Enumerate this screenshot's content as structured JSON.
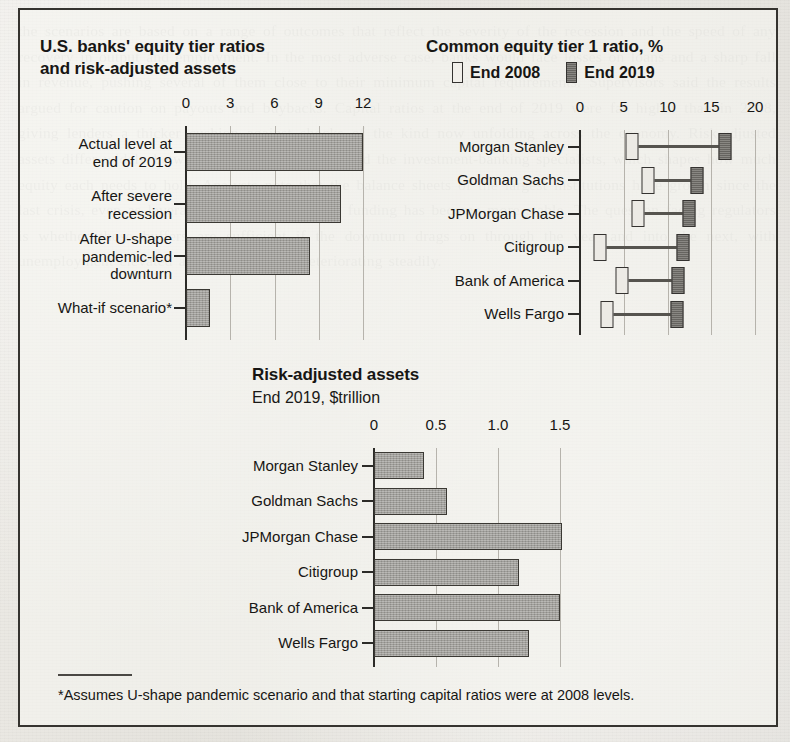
{
  "figure": {
    "footnote": "*Assumes U-shape pandemic scenario and that starting capital ratios were at 2008 levels.",
    "background_text": "the scenarios are based on a range of outcomes that reflect the severity of the recession and the speed of any recovery in output and employment. In the most adverse case, banks would face losses on loans and a sharp fall in revenue, pushing several of them close to their minimum capital requirements. Supervisors said the results argued for caution on payouts and buybacks. Capital ratios at the end of 2019 were far higher than in 2008, giving lenders a thicker cushion against shocks of the kind now unfolding across the economy. Risk-adjusted assets differ widely between the universal banks and the investment-banking specialists, which shapes how much equity each needs to hold. Analysts note that the balance sheets of the largest institutions have grown since the last crisis, even as leverage has come down and funding has become more stable. The question facing regulators is whether those buffers are sufficient if the downturn drags on through the year and into the next, with unemployment elevated and credit quality deteriorating steadily."
  },
  "panels": {
    "equity_tier": {
      "title_line1": "U.S. banks' equity tier ratios",
      "title_line2": "and risk-adjusted assets"
    },
    "cet1": {
      "title": "Common equity tier 1 ratio, %",
      "legend": [
        {
          "label": "End 2008",
          "swatch": "outlined-light-rect",
          "color": "#f1efea"
        },
        {
          "label": "End 2019",
          "swatch": "filled-dark-rect",
          "color": "#74726d"
        }
      ]
    },
    "rwa": {
      "title": "Risk-adjusted assets",
      "subtitle": "End 2019, $trillion"
    }
  },
  "chart_data": [
    {
      "type": "bar",
      "title": "U.S. banks' equity tier ratios and risk-adjusted assets",
      "orientation": "horizontal",
      "categories": [
        "Actual level at\nend of 2019",
        "After severe\nrecession",
        "After U-shape\npandemic-led\ndownturn",
        "What-if scenario*"
      ],
      "values": [
        12.0,
        10.5,
        8.4,
        1.6
      ],
      "xlabel": "",
      "ylabel": "",
      "xlim": [
        0,
        12
      ],
      "xticks": [
        0,
        3,
        6,
        9,
        12
      ],
      "xtick_labels": [
        "0",
        "3",
        "6",
        "9",
        "12"
      ],
      "grid": true,
      "legend": "none",
      "bar_color": "#9c9a95"
    },
    {
      "type": "dumbbell",
      "title": "Common equity tier 1 ratio, %",
      "orientation": "horizontal",
      "categories": [
        "Morgan Stanley",
        "Goldman Sachs",
        "JPMorgan Chase",
        "Citigroup",
        "Bank of America",
        "Wells Fargo"
      ],
      "series": [
        {
          "name": "End 2008",
          "values": [
            5.9,
            7.8,
            6.6,
            2.3,
            4.8,
            3.1
          ],
          "color": "#f1efea"
        },
        {
          "name": "End 2019",
          "values": [
            16.6,
            13.4,
            12.4,
            11.8,
            11.2,
            11.1
          ],
          "color": "#74726d"
        }
      ],
      "xlabel": "%",
      "ylabel": "",
      "xlim": [
        0,
        20
      ],
      "xticks": [
        0,
        5,
        10,
        15,
        20
      ],
      "xtick_labels": [
        "0",
        "5",
        "10",
        "15",
        "20"
      ],
      "grid": true,
      "legend": "top"
    },
    {
      "type": "bar",
      "title": "Risk-adjusted assets",
      "subtitle": "End 2019, $trillion",
      "orientation": "horizontal",
      "categories": [
        "Morgan Stanley",
        "Goldman Sachs",
        "JPMorgan Chase",
        "Citigroup",
        "Bank of America",
        "Wells Fargo"
      ],
      "values": [
        0.4,
        0.59,
        1.52,
        1.17,
        1.5,
        1.25
      ],
      "xlabel": "$trillion",
      "ylabel": "",
      "xlim": [
        0,
        1.5
      ],
      "xticks": [
        0,
        0.5,
        1.0,
        1.5
      ],
      "xtick_labels": [
        "0",
        "0.5",
        "1.0",
        "1.5"
      ],
      "grid": true,
      "legend": "none",
      "bar_color": "#9c9a95"
    }
  ]
}
